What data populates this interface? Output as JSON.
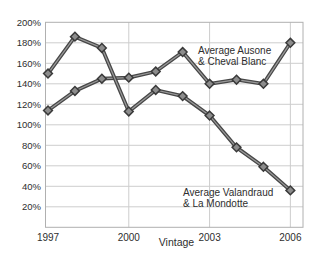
{
  "chart_data": {
    "type": "line",
    "title": "",
    "xlabel": "Vintage",
    "ylabel": "",
    "ylim": [
      0,
      200
    ],
    "ytick_step": 20,
    "grid": true,
    "legend": "inline-annotations",
    "x": [
      1997,
      1998,
      1999,
      2000,
      2001,
      2002,
      2003,
      2004,
      2005,
      2006
    ],
    "series": [
      {
        "id": "ausone-cheval-blanc",
        "name": "Average Ausone & Cheval Blanc",
        "values": [
          114,
          133,
          145,
          146,
          152,
          171,
          140,
          144,
          140,
          180
        ]
      },
      {
        "id": "valandraud-la-mondotte",
        "name": "Average Valandraud & La Mondotte",
        "values": [
          150,
          186,
          175,
          113,
          134,
          128,
          109,
          78,
          59,
          36
        ]
      }
    ],
    "ytick_labels": [
      "20%",
      "40%",
      "60%",
      "80%",
      "100%",
      "120%",
      "140%",
      "160%",
      "180%",
      "200%"
    ],
    "xtick_labels": [
      "1997",
      "2000",
      "2003",
      "2006"
    ],
    "xtick_years": [
      1997,
      2000,
      2003,
      2006
    ],
    "x_gridline_years": [
      2000,
      2003,
      2006
    ],
    "annotations": [
      {
        "line1": "Average Ausone",
        "line2": "& Cheval Blanc",
        "x": 198,
        "y1": 54,
        "y2": 65.3
      },
      {
        "line1": "Average Valandraud",
        "line2": "& La Mondotte",
        "x": 183,
        "y1": 196,
        "y2": 207.3
      }
    ],
    "colors": {
      "line_edge": "#474747",
      "line_core": "#9a9a9a",
      "marker_fill": "#8c8c8c",
      "marker_edge": "#3a3a3a",
      "grid": "#cdcdcd",
      "frame": "#b0b0b0",
      "text": "#2e2e2e"
    }
  }
}
